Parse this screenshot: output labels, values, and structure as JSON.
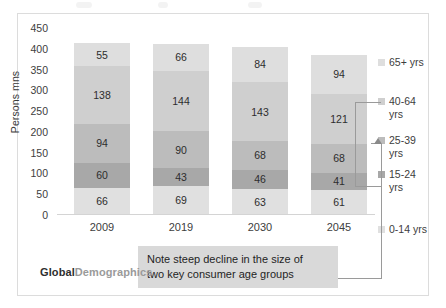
{
  "chart_data": {
    "type": "bar",
    "subtype": "stacked-column",
    "title": "",
    "xlabel": "",
    "ylabel": "Persons mns",
    "categories": [
      "2009",
      "2019",
      "2030",
      "2045"
    ],
    "ylim": [
      0,
      450
    ],
    "yticks": [
      450,
      400,
      350,
      300,
      250,
      200,
      150,
      100,
      50,
      0
    ],
    "grid": false,
    "legend_position": "right",
    "stack_order_bottom_to_top": [
      "0-14 yrs",
      "15-24 yrs",
      "25-39 yrs",
      "40-64 yrs",
      "65+ yrs"
    ],
    "series": [
      {
        "name": "0-14 yrs",
        "color": "#e0e0e0",
        "values": [
          66,
          69,
          63,
          61
        ]
      },
      {
        "name": "15-24 yrs",
        "color": "#a8a8a8",
        "values": [
          60,
          43,
          46,
          41
        ]
      },
      {
        "name": "25-39 yrs",
        "color": "#bcbcbc",
        "values": [
          94,
          90,
          68,
          68
        ]
      },
      {
        "name": "40-64 yrs",
        "color": "#cfcfcf",
        "values": [
          138,
          144,
          143,
          121
        ]
      },
      {
        "name": "65+ yrs",
        "color": "#dedede",
        "values": [
          55,
          66,
          84,
          94
        ]
      }
    ],
    "totals": [
      413,
      412,
      404,
      385
    ],
    "annotations": [
      {
        "text": "Note steep decline in the size of two key consumer age groups",
        "target": "2045 bar: 40-64 yrs and 25-39 yrs segments"
      }
    ]
  },
  "legend": {
    "items": [
      {
        "label": "65+ yrs",
        "color": "#dedede"
      },
      {
        "label": "40-64\nyrs",
        "color": "#cfcfcf"
      },
      {
        "label": "25-39\nyrs",
        "color": "#bcbcbc"
      },
      {
        "label": "15-24\nyrs",
        "color": "#a8a8a8"
      },
      {
        "label": "0-14 yrs",
        "color": "#e0e0e0"
      }
    ]
  },
  "callout": {
    "line1": "Note steep decline in the size of",
    "line2": "two key consumer age groups"
  },
  "logo": {
    "strong": "Global",
    "light": "Demographics"
  }
}
